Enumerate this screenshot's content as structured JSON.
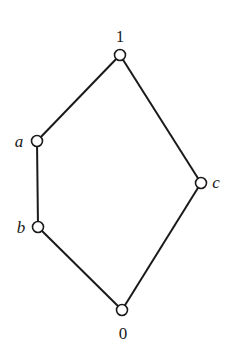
{
  "diagram": {
    "type": "hasse-diagram",
    "colors": {
      "line": "#1a1a1a",
      "node_fill": "#ffffff",
      "background": "#ffffff"
    },
    "nodes": [
      {
        "id": "top",
        "label": "1",
        "x": 120,
        "y": 55,
        "label_x": 120,
        "label_y": 42,
        "italic": false
      },
      {
        "id": "a",
        "label": "a",
        "x": 37,
        "y": 141,
        "label_x": 19,
        "label_y": 147,
        "italic": true
      },
      {
        "id": "b",
        "label": "b",
        "x": 38,
        "y": 227,
        "label_x": 21,
        "label_y": 233,
        "italic": true
      },
      {
        "id": "c",
        "label": "c",
        "x": 201,
        "y": 183,
        "label_x": 216,
        "label_y": 188,
        "italic": true
      },
      {
        "id": "bottom",
        "label": "0",
        "x": 122,
        "y": 310,
        "label_x": 123,
        "label_y": 339,
        "italic": false
      }
    ],
    "edges": [
      [
        "top",
        "a"
      ],
      [
        "a",
        "b"
      ],
      [
        "b",
        "bottom"
      ],
      [
        "top",
        "c"
      ],
      [
        "c",
        "bottom"
      ]
    ]
  }
}
